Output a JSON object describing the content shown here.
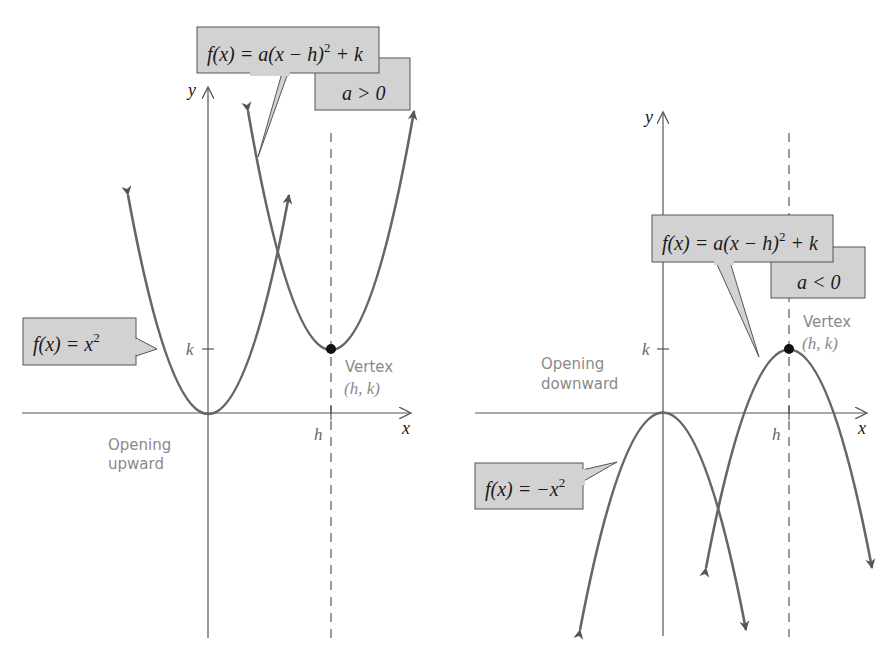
{
  "left_graph": {
    "axis_y_label": "y",
    "axis_x_label": "x",
    "tick_k": "k",
    "tick_h": "h",
    "callout_general": {
      "func": "f(x) = a(x − h)",
      "exp": "2",
      "tail": " + k",
      "condition": "a > 0"
    },
    "callout_basic": {
      "func": "f(x) = x",
      "exp": "2"
    },
    "vertex_label": "Vertex",
    "vertex_coords": "(h, k)",
    "note_line1": "Opening",
    "note_line2": "upward"
  },
  "right_graph": {
    "axis_y_label": "y",
    "axis_x_label": "x",
    "tick_k": "k",
    "tick_h": "h",
    "callout_general": {
      "func": "f(x) = a(x − h)",
      "exp": "2",
      "tail": " + k",
      "condition": "a < 0"
    },
    "callout_basic": {
      "func": "f(x) = −x",
      "exp": "2"
    },
    "vertex_label": "Vertex",
    "vertex_coords": "(h, k)",
    "note_line1": "Opening",
    "note_line2": "downward"
  },
  "colors": {
    "box_fill": "#d2d2d2",
    "curve": "#666666",
    "axis": "#555555",
    "label_gray": "#8a8a8a"
  }
}
